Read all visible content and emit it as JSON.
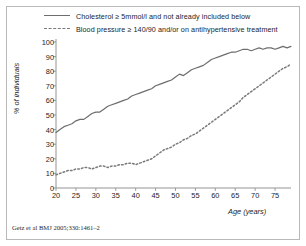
{
  "figure": {
    "citation": "Getz et al BMJ 2005;330:1461–2"
  },
  "legend": {
    "items": [
      {
        "label": "Cholesterol ≥ 5mmol/l and not already included below",
        "style": "solid",
        "color": "#6e6e6e",
        "icon": "solid-line-icon"
      },
      {
        "label": "Blood pressure ≥ 140/90 and/or on antihypertensive treatment",
        "style": "dashed",
        "color": "#7a7a7a",
        "icon": "dashed-line-icon"
      }
    ]
  },
  "chart_data": {
    "type": "line",
    "title": "",
    "subtitle": "",
    "xlabel": "Age (years)",
    "ylabel": "% of individuals",
    "xlim": [
      20,
      79
    ],
    "ylim": [
      0,
      100
    ],
    "xticks": [
      20,
      25,
      30,
      35,
      40,
      45,
      50,
      55,
      60,
      65,
      70,
      75
    ],
    "yticks": [
      0,
      10,
      20,
      30,
      40,
      50,
      60,
      70,
      80,
      90,
      100
    ],
    "grid": false,
    "legend_position": "top",
    "x": [
      20,
      21,
      22,
      23,
      24,
      25,
      26,
      27,
      28,
      29,
      30,
      31,
      32,
      33,
      34,
      35,
      36,
      37,
      38,
      39,
      40,
      41,
      42,
      43,
      44,
      45,
      46,
      47,
      48,
      49,
      50,
      51,
      52,
      53,
      54,
      55,
      56,
      57,
      58,
      59,
      60,
      61,
      62,
      63,
      64,
      65,
      66,
      67,
      68,
      69,
      70,
      71,
      72,
      73,
      74,
      75,
      76,
      77,
      78,
      79
    ],
    "series": [
      {
        "name": "Cholesterol ≥ 5mmol/l and not already included below",
        "style": "solid",
        "color": "#6e6e6e",
        "values": [
          38,
          40,
          42,
          43,
          44,
          46,
          47,
          47,
          49,
          51,
          52,
          52,
          54,
          56,
          57,
          58,
          59,
          60,
          61,
          63,
          64,
          65,
          66,
          67,
          68,
          70,
          71,
          72,
          73,
          74,
          76,
          78,
          77,
          79,
          81,
          82,
          83,
          84,
          86,
          88,
          89,
          90,
          91,
          92,
          93,
          93,
          94,
          95,
          95,
          94,
          95,
          96,
          95,
          96,
          96,
          95,
          96,
          97,
          96,
          97
        ]
      },
      {
        "name": "Blood pressure ≥ 140/90 and/or on antihypertensive treatment",
        "style": "dashed",
        "color": "#7a7a7a",
        "values": [
          9,
          10,
          11,
          12,
          12,
          13,
          13,
          14,
          14,
          13,
          14,
          15,
          15,
          14,
          15,
          15,
          16,
          16,
          17,
          17,
          16,
          17,
          18,
          19,
          20,
          22,
          24,
          26,
          27,
          28,
          30,
          31,
          33,
          34,
          36,
          37,
          39,
          41,
          43,
          45,
          47,
          49,
          51,
          53,
          55,
          57,
          59,
          62,
          64,
          66,
          68,
          70,
          72,
          74,
          76,
          78,
          80,
          82,
          83,
          85
        ]
      }
    ],
    "annotations": [
      "Getz et al BMJ 2005;330:1461–2"
    ]
  }
}
